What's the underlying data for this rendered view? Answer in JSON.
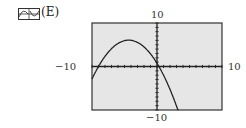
{
  "option": {
    "icon": "graph-thumbnail-icon",
    "label": "(E)"
  },
  "colors": {
    "plot_background": "#e6e6e6",
    "axis": "#222222",
    "curve": "#222222",
    "frame": "#333333"
  },
  "chart_data": {
    "type": "line",
    "title": "",
    "xlabel": "",
    "ylabel": "",
    "xlim": [
      -10,
      10
    ],
    "ylim": [
      -10,
      10
    ],
    "tick_labels": {
      "x_min": "−10",
      "x_max": "10",
      "y_min": "−10",
      "y_max": "10"
    },
    "grid": false,
    "series": [
      {
        "name": "downward parabola",
        "x": [
          -10,
          -9,
          -8,
          -7,
          -6,
          -5,
          -4.35,
          -4,
          -3,
          -2,
          -1,
          0,
          1,
          2,
          3,
          3.8
        ],
        "y": [
          -2.9,
          0,
          2.3,
          4.0,
          5.2,
          5.9,
          6.0,
          6.0,
          5.5,
          4.4,
          2.7,
          0.8,
          -1.3,
          -4.0,
          -7.3,
          -10
        ]
      }
    ]
  }
}
